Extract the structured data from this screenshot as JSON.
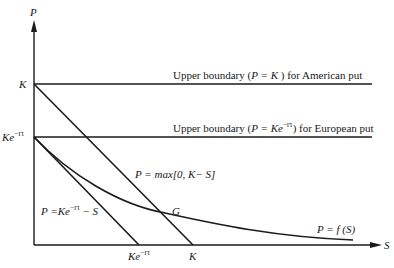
{
  "axes": {
    "y_label": "P",
    "x_label": "S"
  },
  "y_ticks": {
    "k": "K",
    "ke": "Ke",
    "ke_sup": "−rτ"
  },
  "x_ticks": {
    "ke": "Ke",
    "ke_sup": "−rτ",
    "k": "K"
  },
  "boundaries": {
    "american": {
      "prefix": "Upper boundary  (",
      "eq": "P = K",
      "suffix": " ) for American put"
    },
    "european": {
      "prefix": "Upper boundary  (",
      "eq": "P = Ke",
      "sup": "−rτ",
      "suffix": ") for European put"
    }
  },
  "curve_labels": {
    "intrinsic": "P = max[0, K− S]",
    "lower": {
      "main": "P =Ke",
      "sup": "−rτ",
      "tail": " − S"
    },
    "put_value": "P = f (S)",
    "point_g": "G"
  },
  "colors": {
    "line": "#1a1a1a",
    "background": "#ffffff"
  }
}
